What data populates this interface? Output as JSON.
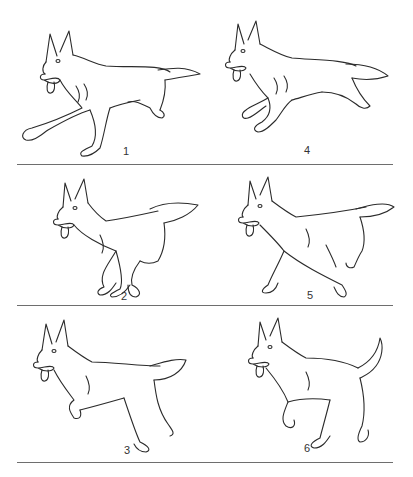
{
  "frames": [
    {
      "id": 1,
      "label": "1",
      "pose": "stride-extended-front"
    },
    {
      "id": 2,
      "label": "2",
      "pose": "gathered-legs-under"
    },
    {
      "id": 3,
      "label": "3",
      "pose": "front-paw-lifted"
    },
    {
      "id": 4,
      "label": "4",
      "pose": "suspension-leap"
    },
    {
      "id": 5,
      "label": "5",
      "pose": "diagonal-stride"
    },
    {
      "id": 6,
      "label": "6",
      "pose": "collected-tail-up"
    }
  ],
  "layout": {
    "columns": 2,
    "rows": 3,
    "dividers": 3
  },
  "colors": {
    "line": "#2b2b2b",
    "divider": "#555555",
    "background": "#ffffff"
  }
}
